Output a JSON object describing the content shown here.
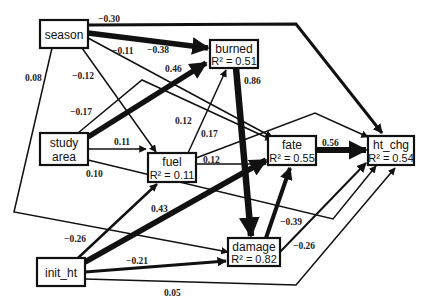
{
  "nodes": {
    "season": {
      "label": "season"
    },
    "burned": {
      "label": "burned",
      "r2": "R² = 0.51"
    },
    "study_area": {
      "label_line1": "study",
      "label_line2": "area"
    },
    "fuel": {
      "label": "fuel",
      "r2": "R² = 0.11"
    },
    "fate": {
      "label": "fate",
      "r2": "R² = 0.55"
    },
    "ht_chg": {
      "label": "ht_chg",
      "r2": "R² = 0.54"
    },
    "damage": {
      "label": "damage",
      "r2": "R² = 0.82"
    },
    "init_ht": {
      "label": "init_ht"
    }
  },
  "edges": [
    {
      "from": "season",
      "to": "ht_chg",
      "coef": "−0.30"
    },
    {
      "from": "season",
      "to": "burned",
      "coef": "−0.38"
    },
    {
      "from": "season",
      "to": "fate",
      "coef": "−0.11"
    },
    {
      "from": "season",
      "to": "fuel",
      "coef": "−0.12"
    },
    {
      "from": "season",
      "to": "damage",
      "coef": "0.08"
    },
    {
      "from": "study_area",
      "to": "burned",
      "coef": "0.46"
    },
    {
      "from": "study_area",
      "to": "fate",
      "coef": "−0.17"
    },
    {
      "from": "study_area",
      "to": "fuel",
      "coef": "0.11"
    },
    {
      "from": "study_area",
      "to": "ht_chg",
      "coef": "0.10"
    },
    {
      "from": "fuel",
      "to": "burned",
      "coef": "0.12"
    },
    {
      "from": "fuel",
      "to": "ht_chg",
      "coef": "0.17"
    },
    {
      "from": "fuel",
      "to": "fate",
      "coef": "0.12"
    },
    {
      "from": "burned",
      "to": "damage",
      "coef": "0.86"
    },
    {
      "from": "fate",
      "to": "ht_chg",
      "coef": "0.56"
    },
    {
      "from": "damage",
      "to": "fate",
      "coef": "−0.39"
    },
    {
      "from": "damage",
      "to": "ht_chg",
      "coef": "−0.26"
    },
    {
      "from": "init_ht",
      "to": "fuel",
      "coef": "−0.26"
    },
    {
      "from": "init_ht",
      "to": "fate",
      "coef": "0.43"
    },
    {
      "from": "init_ht",
      "to": "damage",
      "coef": "−0.21"
    },
    {
      "from": "init_ht",
      "to": "ht_chg",
      "coef": "0.05"
    }
  ]
}
